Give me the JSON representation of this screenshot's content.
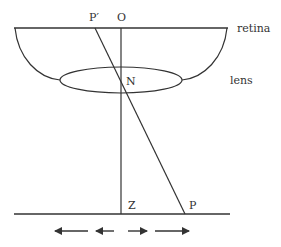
{
  "diagram": {
    "labels": {
      "p_prime": "P′",
      "o": "O",
      "retina": "retina",
      "n": "N",
      "lens": "lens",
      "z": "Z",
      "p": "P"
    },
    "colors": {
      "stroke": "#333333",
      "background": "#ffffff"
    },
    "arrows": [
      {
        "direction": "left",
        "length": "long"
      },
      {
        "direction": "left",
        "length": "short"
      },
      {
        "direction": "right",
        "length": "short"
      },
      {
        "direction": "right",
        "length": "long"
      }
    ]
  }
}
